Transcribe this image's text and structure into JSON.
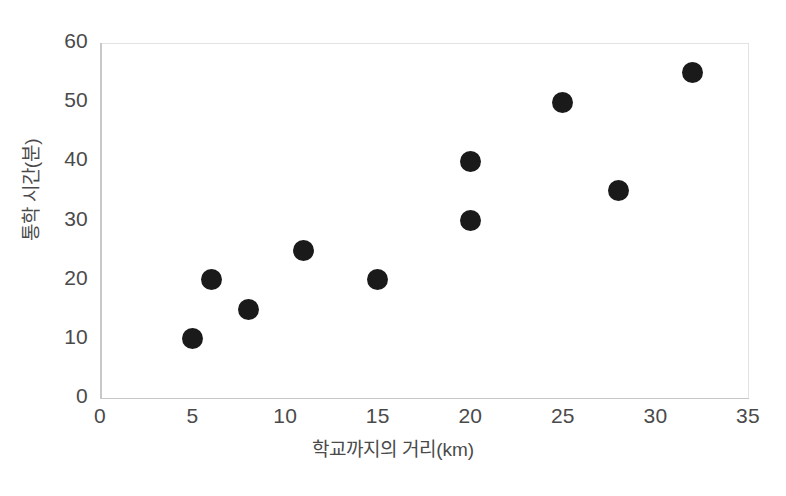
{
  "chart_data": {
    "type": "scatter",
    "title": "",
    "xlabel": "학교까지의 거리(km)",
    "ylabel": "통학 시간(분)",
    "xlim": [
      0,
      35
    ],
    "ylim": [
      0,
      60
    ],
    "xticks": [
      0,
      5,
      10,
      15,
      20,
      25,
      30,
      35
    ],
    "yticks": [
      0,
      10,
      20,
      30,
      40,
      50,
      60
    ],
    "xtick_labels": [
      "0",
      "5",
      "10",
      "15",
      "20",
      "25",
      "30",
      "35"
    ],
    "ytick_labels": [
      "0",
      "10",
      "20",
      "30",
      "40",
      "50",
      "60"
    ],
    "grid": false,
    "legend": false,
    "marker_color": "#1a1a1a",
    "marker_shape": "circle",
    "x": [
      5,
      6,
      8,
      11,
      15,
      20,
      20,
      25,
      28,
      32
    ],
    "y": [
      10,
      20,
      15,
      25,
      20,
      30,
      40,
      50,
      35,
      55
    ],
    "points": [
      {
        "x": 5,
        "y": 10
      },
      {
        "x": 6,
        "y": 20
      },
      {
        "x": 8,
        "y": 15
      },
      {
        "x": 11,
        "y": 25
      },
      {
        "x": 15,
        "y": 20
      },
      {
        "x": 20,
        "y": 30
      },
      {
        "x": 20,
        "y": 40
      },
      {
        "x": 25,
        "y": 50
      },
      {
        "x": 28,
        "y": 35
      },
      {
        "x": 32,
        "y": 55
      }
    ]
  },
  "colors": {
    "background": "#ffffff",
    "axis": "#c8c8c8",
    "frame": "#e3e3e3",
    "text": "#4a4a4a",
    "marker": "#1a1a1a"
  }
}
